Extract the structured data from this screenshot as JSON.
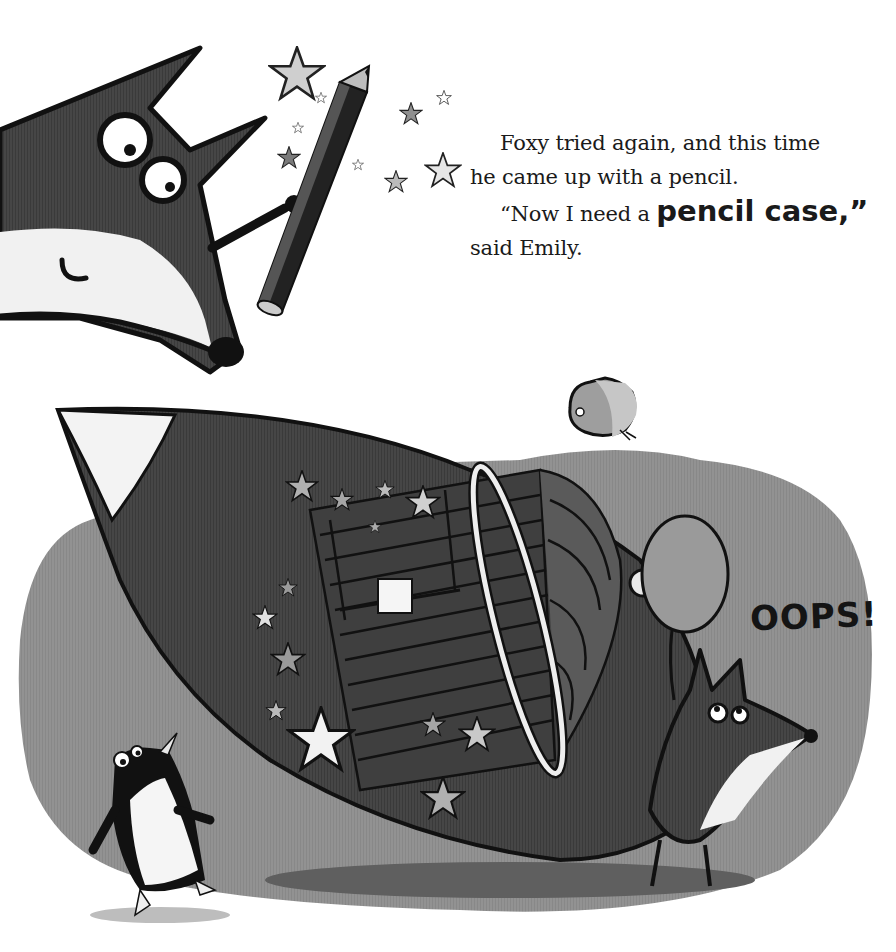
{
  "page": {
    "type": "picture-book-page",
    "story_text": {
      "line1": "Foxy tried again, and this time",
      "line2": "he came up with a pencil.",
      "line3_prefix": "“Now I need a ",
      "line3_emphasis": "pencil case,”",
      "line4": "said Emily."
    },
    "sound_effect": "OOPS!"
  },
  "illustration": {
    "characters": [
      "fox-head-large",
      "penguin",
      "small-fox",
      "bird"
    ],
    "objects": [
      "pencil",
      "giant-pencil-case-tail",
      "bird-cage",
      "balloon",
      "stars"
    ],
    "colors": {
      "background": "#ffffff",
      "ground_blob": "#8f8f8f",
      "fox_fur": "#4a4a4a",
      "fox_dark": "#3c3c3c",
      "outline": "#111111",
      "white_fur": "#f2f2f2",
      "star_light": "#c9c9c9",
      "star_mid": "#9a9a9a",
      "shadow": "#5e5e5e"
    }
  }
}
